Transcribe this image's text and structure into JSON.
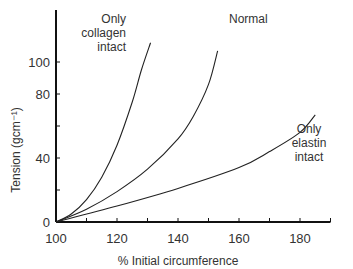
{
  "chart_data": {
    "type": "line",
    "title": "",
    "xlabel": "% Initial circumference",
    "ylabel": "Tension (gcm⁻¹)",
    "xlim": [
      100,
      190
    ],
    "ylim": [
      0,
      112
    ],
    "x_ticks": [
      "100",
      "120",
      "140",
      "160",
      "180"
    ],
    "y_ticks": [
      "0",
      "40",
      "80",
      "100"
    ],
    "grid": false,
    "legend": "inline labels at curve ends",
    "series": [
      {
        "name": "Only collagen intact",
        "label_lines": [
          "Only",
          "collagen",
          "intact"
        ],
        "x": [
          100,
          105,
          110,
          115,
          120,
          125,
          128,
          131
        ],
        "y": [
          0,
          5,
          14,
          28,
          48,
          75,
          95,
          112
        ]
      },
      {
        "name": "Normal",
        "label_lines": [
          "Normal"
        ],
        "x": [
          100,
          110,
          120,
          130,
          140,
          145,
          150,
          153
        ],
        "y": [
          0,
          8,
          19,
          33,
          52,
          66,
          86,
          107
        ]
      },
      {
        "name": "Only elastin intact",
        "label_lines": [
          "Only",
          "elastin",
          "intact"
        ],
        "x": [
          100,
          120,
          140,
          160,
          170,
          180,
          185
        ],
        "y": [
          0,
          10,
          21,
          34,
          44,
          56,
          67
        ]
      }
    ]
  }
}
